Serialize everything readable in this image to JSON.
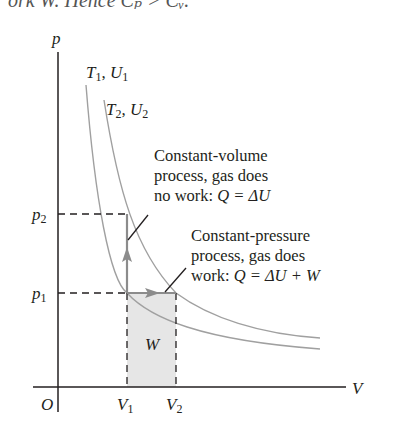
{
  "top_caption_fragment": "ork W. Hence Cₚ > Cᵥ.",
  "axes": {
    "y_label": "p",
    "x_label": "V",
    "origin_label": "O"
  },
  "isotherms": [
    {
      "label_T": "T",
      "label_T_sub": "1",
      "label_U": "U",
      "label_U_sub": "1"
    },
    {
      "label_T": "T",
      "label_T_sub": "2",
      "label_U": "U",
      "label_U_sub": "2"
    }
  ],
  "ticks": {
    "p1": {
      "base": "p",
      "sub": "1"
    },
    "p2": {
      "base": "p",
      "sub": "2"
    },
    "V1": {
      "base": "V",
      "sub": "1"
    },
    "V2": {
      "base": "V",
      "sub": "2"
    }
  },
  "work_label": "W",
  "annotations": {
    "constant_volume": {
      "line1": "Constant-volume",
      "line2": "process, gas does",
      "line3_text": "no work: ",
      "line3_eq": "Q = ΔU"
    },
    "constant_pressure": {
      "line1": "Constant-pressure",
      "line2": "process, gas does",
      "line3_text": "work: ",
      "line3_eq": "Q = ΔU + W"
    }
  },
  "colors": {
    "axis": "#231f20",
    "curve": "#9a9a9a",
    "arrow": "#8c8c8c",
    "shaded_area": "#e6e6e6",
    "dashed": "#231f20"
  }
}
